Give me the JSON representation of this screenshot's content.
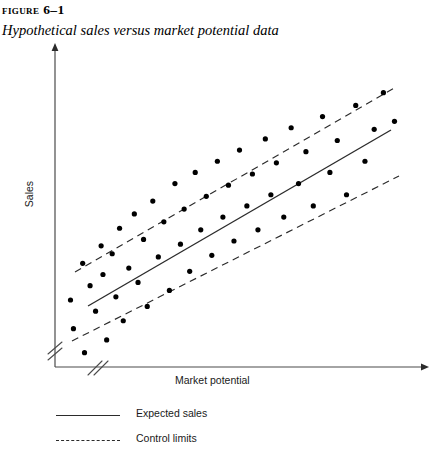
{
  "header": {
    "figure_number": "Figure 6–1",
    "caption": "Hypothetical sales versus market potential data"
  },
  "legend": {
    "expected_label": "Expected sales",
    "control_label": "Control limits"
  },
  "axes": {
    "x_title": "Market potential",
    "y_title": "Sales"
  },
  "colors": {
    "line": "#2b2b2b",
    "point": "#000000",
    "axis": "#4a4a4a",
    "text": "#1a1a1a"
  },
  "chart_data": {
    "type": "scatter",
    "title": "Hypothetical sales versus market potential data",
    "xlabel": "Market potential",
    "ylabel": "Sales",
    "xlim": [
      0,
      100
    ],
    "ylim": [
      0,
      100
    ],
    "grid": false,
    "axis_ticks": false,
    "axis_breaks": {
      "x": true,
      "y": true
    },
    "axis_arrows": {
      "x": true,
      "y": true
    },
    "legend_position": "below-plot",
    "series": [
      {
        "name": "Observations",
        "type": "scatter",
        "marker": "filled-circle",
        "points": [
          [
            4.2,
            21.0
          ],
          [
            5.0,
            12.0
          ],
          [
            7.5,
            32.5
          ],
          [
            8.0,
            4.5
          ],
          [
            9.5,
            25.5
          ],
          [
            11.0,
            17.5
          ],
          [
            12.5,
            38.0
          ],
          [
            13.0,
            29.0
          ],
          [
            14.0,
            8.5
          ],
          [
            15.5,
            35.5
          ],
          [
            16.5,
            22.0
          ],
          [
            17.5,
            43.5
          ],
          [
            18.5,
            14.5
          ],
          [
            20.0,
            31.0
          ],
          [
            21.5,
            48.0
          ],
          [
            22.5,
            26.5
          ],
          [
            24.0,
            40.0
          ],
          [
            25.0,
            19.0
          ],
          [
            26.5,
            52.0
          ],
          [
            28.0,
            34.5
          ],
          [
            29.5,
            45.5
          ],
          [
            31.0,
            24.0
          ],
          [
            32.5,
            57.5
          ],
          [
            34.0,
            38.5
          ],
          [
            35.0,
            49.5
          ],
          [
            36.5,
            30.0
          ],
          [
            38.0,
            61.0
          ],
          [
            39.5,
            43.0
          ],
          [
            41.0,
            53.5
          ],
          [
            42.5,
            35.0
          ],
          [
            44.0,
            64.5
          ],
          [
            45.5,
            47.0
          ],
          [
            47.0,
            57.0
          ],
          [
            48.5,
            39.5
          ],
          [
            50.0,
            68.0
          ],
          [
            52.0,
            50.5
          ],
          [
            53.5,
            60.5
          ],
          [
            55.0,
            43.0
          ],
          [
            57.0,
            71.5
          ],
          [
            58.5,
            54.0
          ],
          [
            60.0,
            64.0
          ],
          [
            62.0,
            47.0
          ],
          [
            64.0,
            75.0
          ],
          [
            66.0,
            57.5
          ],
          [
            68.0,
            67.5
          ],
          [
            70.0,
            50.5
          ],
          [
            72.5,
            78.5
          ],
          [
            74.5,
            61.0
          ],
          [
            76.5,
            71.0
          ],
          [
            79.0,
            54.0
          ],
          [
            81.5,
            82.0
          ],
          [
            84.0,
            64.5
          ],
          [
            86.5,
            74.5
          ],
          [
            89.0,
            86.0
          ],
          [
            92.0,
            77.0
          ]
        ]
      },
      {
        "name": "Expected sales",
        "type": "line",
        "style": "solid",
        "x": [
          8.0,
          95.0
        ],
        "y": [
          22.0,
          79.0
        ]
      },
      {
        "name": "Control limit upper",
        "type": "line",
        "style": "dashed",
        "x": [
          5.5,
          96.5
        ],
        "y": [
          32.5,
          91.5
        ]
      },
      {
        "name": "Control limit lower",
        "type": "line",
        "style": "dashed",
        "x": [
          5.0,
          98.0
        ],
        "y": [
          10.5,
          67.5
        ]
      }
    ]
  }
}
